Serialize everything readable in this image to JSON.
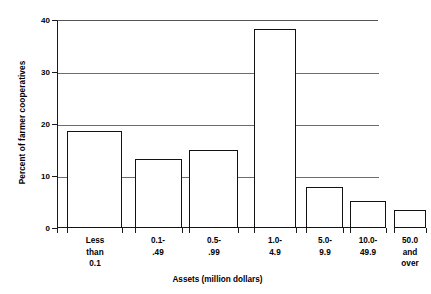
{
  "chart_data": {
    "type": "bar",
    "title": "",
    "xlabel": "Assets (million dollars)",
    "ylabel": "Percent of farmer cooperatives",
    "categories": [
      "Less\nthan\n0.1",
      "0.1-\n.49",
      "0.5-\n.99",
      "1.0-\n4.9",
      "5.0-\n9.9",
      "10.0-\n49.9",
      "50.0\nand\nover"
    ],
    "category_lines": [
      [
        "Less",
        "than",
        "0.1"
      ],
      [
        "0.1-",
        ".49"
      ],
      [
        "0.5-",
        ".99"
      ],
      [
        "1.0-",
        "4.9"
      ],
      [
        "5.0-",
        "9.9"
      ],
      [
        "10.0-",
        "49.9"
      ],
      [
        "50.0",
        "and",
        "over"
      ]
    ],
    "values": [
      18.6,
      13.2,
      15.0,
      38.3,
      7.9,
      5.2,
      3.5
    ],
    "ylim": [
      0,
      40
    ],
    "yticks": [
      0,
      10,
      20,
      30,
      40
    ],
    "ytick_labels": [
      "0",
      "10",
      "20",
      "30",
      "40"
    ],
    "grid": "horizontal",
    "legend": "none",
    "bar_fill_color": "#ffffff",
    "bar_edge_color": "#121212",
    "axis_color": "#1a1a1a",
    "grid_color": "#6d6d6d",
    "background_color": "#ffffff"
  },
  "layout": {
    "bar_geometry": [
      {
        "left_pct": 3.1,
        "width_pct": 17.1
      },
      {
        "left_pct": 24.3,
        "width_pct": 14.6
      },
      {
        "left_pct": 41.1,
        "width_pct": 15.3
      },
      {
        "left_pct": 61.4,
        "width_pct": 13.1
      },
      {
        "left_pct": 77.6,
        "width_pct": 11.5
      },
      {
        "left_pct": 91.3,
        "width_pct": 11.2
      },
      {
        "left_pct": 105.0,
        "width_pct": 10.0
      }
    ]
  }
}
